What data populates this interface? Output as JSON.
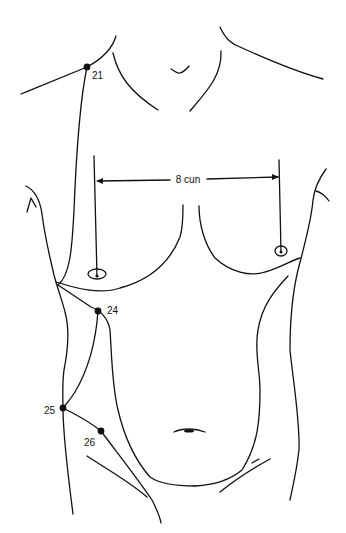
{
  "figure": {
    "type": "anatomical acupuncture point diagram",
    "view": "anterior torso",
    "line_color": "#111111",
    "background": "#ffffff"
  },
  "measurement": {
    "label": "8 cun",
    "description": "distance between nipples"
  },
  "points": [
    {
      "id": "21",
      "label": "21",
      "x": 87,
      "y": 67
    },
    {
      "id": "24",
      "label": "24",
      "x": 98,
      "y": 311
    },
    {
      "id": "25",
      "label": "25",
      "x": 63,
      "y": 408
    },
    {
      "id": "26",
      "label": "26",
      "x": 101,
      "y": 431
    }
  ]
}
